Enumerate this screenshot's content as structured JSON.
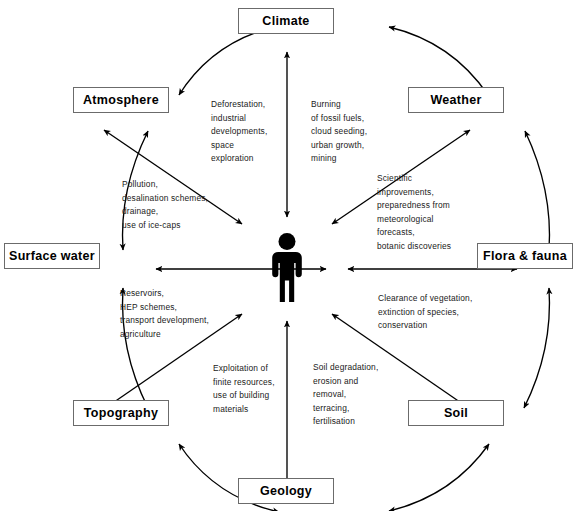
{
  "diagram": {
    "center": {
      "icon": "person-figure-icon",
      "label": "Humans"
    },
    "nodes": [
      {
        "id": "climate",
        "label": "Climate",
        "x": 286,
        "y": 21,
        "w": 96,
        "h": 26
      },
      {
        "id": "weather",
        "label": "Weather",
        "x": 456,
        "y": 100,
        "w": 96,
        "h": 26
      },
      {
        "id": "flora-fauna",
        "label": "Flora & fauna",
        "x": 525,
        "y": 256,
        "w": 96,
        "h": 26
      },
      {
        "id": "soil",
        "label": "Soil",
        "x": 456,
        "y": 413,
        "w": 96,
        "h": 26
      },
      {
        "id": "geology",
        "label": "Geology",
        "x": 286,
        "y": 491,
        "w": 96,
        "h": 26
      },
      {
        "id": "topography",
        "label": "Topography",
        "x": 121,
        "y": 413,
        "w": 96,
        "h": 26
      },
      {
        "id": "surface-water",
        "label": "Surface water",
        "x": 52,
        "y": 256,
        "w": 96,
        "h": 26
      },
      {
        "id": "atmosphere",
        "label": "Atmosphere",
        "x": 121,
        "y": 100,
        "w": 96,
        "h": 26
      }
    ],
    "annotations": [
      {
        "id": "climate-impacts",
        "text": "Deforestation,\nindustrial\ndevelopments,\nspace\nexploration",
        "x": 211,
        "y": 98
      },
      {
        "id": "weather-impacts",
        "text": "Burning\nof fossil fuels,\ncloud seeding,\nurban growth,\nmining",
        "x": 311,
        "y": 98
      },
      {
        "id": "flora-fauna-impacts",
        "text": "Scientific\nimprovements,\npreparedness from\nmeteorological\nforecasts,\nbotanic discoveries",
        "x": 377,
        "y": 172
      },
      {
        "id": "surface-water-impacts",
        "text": "Pollution,\ndesalination schemes,\ndrainage,\nuse of ice-caps",
        "x": 122,
        "y": 178
      },
      {
        "id": "topography-impacts",
        "text": "Reservoirs,\nHEP schemes,\ntransport development,\nagriculture",
        "x": 120,
        "y": 287
      },
      {
        "id": "soil-impacts",
        "text": "Clearance of vegetation,\nextinction of species,\nconservation",
        "x": 378,
        "y": 292
      },
      {
        "id": "geology-impacts",
        "text": "Exploitation of\nfinite resources,\nuse of building\nmaterials",
        "x": 213,
        "y": 362
      },
      {
        "id": "soil-degradation",
        "text": "Soil degradation,\nerosion and\nremoval,\nterracing,\nfertilisation",
        "x": 313,
        "y": 361
      }
    ],
    "colors": {
      "line": "#000000",
      "box_border": "#6b6b6b",
      "background": "#ffffff",
      "text": "#000000",
      "annotation_text": "#1a1a1a",
      "figure": "#000000"
    },
    "edges": {
      "ring_description": "bidirectional arcs connecting adjacent ring nodes",
      "spoke_description": "bidirectional straight arrows between each ring node and the central human figure"
    }
  }
}
